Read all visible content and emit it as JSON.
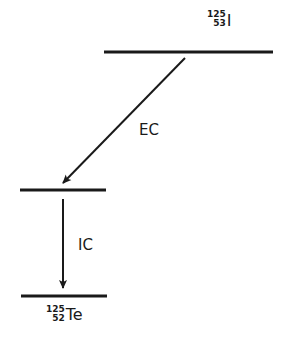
{
  "diagram": {
    "type": "nuclear-decay-scheme",
    "levels": [
      {
        "id": "parent",
        "mass_number": "125",
        "atomic_number": "53",
        "symbol": "I"
      },
      {
        "id": "intermediate"
      },
      {
        "id": "daughter",
        "mass_number": "125",
        "atomic_number": "52",
        "symbol": "Te"
      }
    ],
    "transitions": [
      {
        "from": "parent",
        "to": "intermediate",
        "label": "EC"
      },
      {
        "from": "intermediate",
        "to": "daughter",
        "label": "IC"
      }
    ],
    "colors": {
      "line": "#1a1a1a",
      "background": "#ffffff"
    }
  }
}
